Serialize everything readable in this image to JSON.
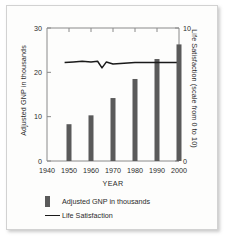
{
  "chart_data": {
    "type": "bar",
    "title": "",
    "xlabel": "YEAR",
    "ylabel": "Adjusted GNP in thousands",
    "y2label": "Life Satisfaction (scale from 0 to 10)",
    "categories": [
      1950,
      1960,
      1970,
      1980,
      1990,
      2000
    ],
    "xlim": [
      1940,
      2000
    ],
    "ylim": [
      0,
      30
    ],
    "y2lim": [
      0,
      10
    ],
    "xticks": [
      "1940",
      "1950",
      "1960",
      "1970",
      "1980",
      "1990",
      "2000"
    ],
    "yticks": [
      "0",
      "10",
      "20",
      "30"
    ],
    "y2ticks": [
      "0",
      "10"
    ],
    "grid": false,
    "legend_position": "below",
    "series": [
      {
        "name": "Adjusted GNP in thousands",
        "type": "bar",
        "axis": "left",
        "color": "#5a5a5a",
        "values": [
          8.3,
          10.3,
          14.2,
          18.5,
          23.0,
          26.3
        ]
      },
      {
        "name": "Life Satisfaction",
        "type": "line",
        "axis": "right",
        "color": "#1a1a1a",
        "x": [
          1948,
          1952,
          1956,
          1960,
          1963,
          1965,
          1967,
          1970,
          1975,
          1980,
          1985,
          1990,
          1995,
          1999
        ],
        "values": [
          7.4,
          7.45,
          7.5,
          7.45,
          7.5,
          7.0,
          7.45,
          7.3,
          7.35,
          7.4,
          7.4,
          7.4,
          7.4,
          7.4
        ]
      }
    ]
  },
  "legend": {
    "bar_label": "Adjusted GNP in thousands",
    "line_label": "Life Satisfaction"
  },
  "axes": {
    "left_title": "Adjusted GNP in thousands",
    "right_title": "Life Satisfaction (scale from 0 to 10)",
    "x_title": "YEAR"
  }
}
